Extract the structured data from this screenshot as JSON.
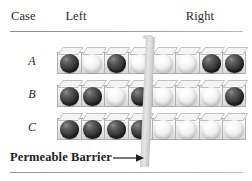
{
  "figure": {
    "name": "permeable-barrier-bead-diagram",
    "header": {
      "case_label": "Case",
      "left_label": "Left",
      "right_label": "Right"
    },
    "caption": {
      "text": "Permeable Barrier",
      "arrow_icon": "right-arrow-icon"
    },
    "barrier": {
      "name": "permeable-barrier",
      "color": "#d8d8d8"
    },
    "colors": {
      "dark_bead": "#333333",
      "light_bead": "#f1f1f1",
      "tray": "#e9e9e9",
      "rule": "#9a9a9a",
      "text": "#1f1f1f"
    },
    "legend": {
      "dark_bead_name": "dark-bead",
      "light_bead_name": "light-bead"
    },
    "rows": [
      {
        "case": "A",
        "left": [
          "dark",
          "light",
          "dark",
          "light"
        ],
        "right": [
          "light",
          "light",
          "dark",
          "dark"
        ]
      },
      {
        "case": "B",
        "left": [
          "dark",
          "dark",
          "light",
          "dark"
        ],
        "right": [
          "light",
          "light",
          "light",
          "dark"
        ]
      },
      {
        "case": "C",
        "left": [
          "dark",
          "dark",
          "dark",
          "dark"
        ],
        "right": [
          "light",
          "light",
          "light",
          "light"
        ]
      }
    ]
  },
  "chart_data": {
    "type": "table",
    "title": "Permeable Barrier",
    "categories": [
      "Left",
      "Right"
    ],
    "series": [
      {
        "name": "A",
        "values": [
          [
            "dark",
            "light",
            "dark",
            "light"
          ],
          [
            "light",
            "light",
            "dark",
            "dark"
          ]
        ],
        "dark_left": 2,
        "dark_right": 2
      },
      {
        "name": "B",
        "values": [
          [
            "dark",
            "dark",
            "light",
            "dark"
          ],
          [
            "light",
            "light",
            "light",
            "dark"
          ]
        ],
        "dark_left": 3,
        "dark_right": 1
      },
      {
        "name": "C",
        "values": [
          [
            "dark",
            "dark",
            "dark",
            "dark"
          ],
          [
            "light",
            "light",
            "light",
            "light"
          ]
        ],
        "dark_left": 4,
        "dark_right": 0
      }
    ],
    "xlabel": "",
    "ylabel": "Case",
    "grid": false,
    "legend": "none"
  }
}
